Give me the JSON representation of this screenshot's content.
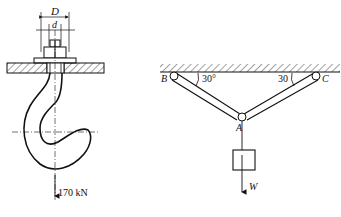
{
  "left_figure": {
    "dimension_outer": "D",
    "dimension_inner": "d",
    "load_label": "170 kN"
  },
  "right_figure": {
    "point_B": "B",
    "point_C": "C",
    "point_A": "A",
    "angle_left": "30°",
    "angle_right": "30",
    "weight_label": "W"
  },
  "colors": {
    "stroke": "#111111",
    "background": "#ffffff"
  }
}
